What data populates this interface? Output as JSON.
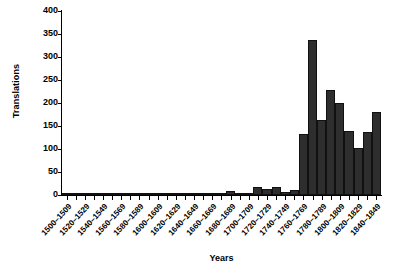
{
  "chart_data": {
    "type": "bar",
    "title": "",
    "xlabel": "Years",
    "ylabel": "Translations",
    "ylim": [
      0,
      400
    ],
    "yticks": [
      0,
      50,
      100,
      150,
      200,
      250,
      300,
      350,
      400
    ],
    "grid": false,
    "legend": null,
    "bar_color": "#2e2e2e",
    "axis_color": "#000000",
    "categories": [
      "1500–1509",
      "1510–1519",
      "1520–1529",
      "1530–1539",
      "1540–1549",
      "1550–1559",
      "1560–1569",
      "1570–1579",
      "1580–1589",
      "1590–1599",
      "1600–1609",
      "1610–1619",
      "1620–1629",
      "1630–1639",
      "1640–1649",
      "1650–1659",
      "1660–1669",
      "1670–1679",
      "1680–1689",
      "1690–1699",
      "1700–1709",
      "1710–1719",
      "1720–1729",
      "1730–1739",
      "1740–1749",
      "1750–1759",
      "1760–1769",
      "1770–1779",
      "1780–1789",
      "1790–1799",
      "1800–1809",
      "1810–1819",
      "1820–1829",
      "1830–1839",
      "1840–1849"
    ],
    "tick_labels_visible": [
      "1500–1509",
      "",
      "1520–1529",
      "",
      "1540–1549",
      "",
      "1560–1569",
      "",
      "1580–1589",
      "",
      "1600–1609",
      "",
      "1620–1629",
      "",
      "1640–1649",
      "",
      "1660–1669",
      "",
      "1680–1689",
      "",
      "1700–1709",
      "",
      "1720–1729",
      "",
      "1740–1749",
      "",
      "1760–1769",
      "",
      "1780–1789",
      "",
      "1800–1809",
      "",
      "1820–1829",
      "",
      "1840–1849"
    ],
    "values": [
      0,
      0,
      1,
      0,
      2,
      0,
      2,
      0,
      1,
      1,
      4,
      5,
      3,
      2,
      1,
      0,
      3,
      1,
      8,
      5,
      4,
      17,
      14,
      18,
      7,
      10,
      132,
      337,
      164,
      229,
      200,
      140,
      102,
      138,
      170
    ],
    "values_note": "final bar 1840-1849 = 180",
    "values_full": [
      0,
      0,
      1,
      0,
      2,
      0,
      2,
      0,
      1,
      1,
      4,
      5,
      3,
      2,
      1,
      0,
      3,
      1,
      8,
      5,
      4,
      17,
      14,
      18,
      7,
      10,
      132,
      337,
      164,
      229,
      200,
      140,
      102,
      138,
      180
    ]
  }
}
